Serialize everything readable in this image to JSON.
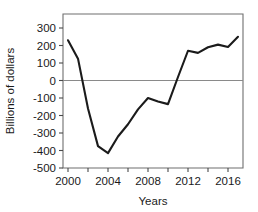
{
  "chart_data": {
    "type": "line",
    "title": "",
    "xlabel": "Years",
    "ylabel": "Billions of dollars",
    "xlim": [
      1999.5,
      2017.5
    ],
    "ylim": [
      -500,
      380
    ],
    "grid": false,
    "legend": null,
    "x_ticks": [
      2000,
      2002,
      2004,
      2006,
      2008,
      2010,
      2012,
      2014,
      2016
    ],
    "x_tick_labels": [
      "2000",
      "",
      "2004",
      "",
      "2008",
      "",
      "2012",
      "",
      "2016"
    ],
    "y_ticks": [
      300,
      200,
      100,
      0,
      -100,
      -200,
      -300,
      -400,
      -500
    ],
    "y_tick_labels": [
      "300",
      "200",
      "100",
      "0",
      "-100",
      "-200",
      "-300",
      "-400",
      "-500"
    ],
    "zero_line": 0,
    "x": [
      2000,
      2001,
      2002,
      2003,
      2004,
      2005,
      2006,
      2007,
      2008,
      2009,
      2010,
      2011,
      2012,
      2013,
      2014,
      2015,
      2016,
      2017
    ],
    "values": [
      230,
      125,
      -160,
      -375,
      -415,
      -320,
      -250,
      -165,
      -100,
      -120,
      -135,
      20,
      170,
      158,
      190,
      205,
      192,
      250
    ],
    "series": [
      {
        "name": "Billions of dollars",
        "color": "#1b1b1b",
        "values": [
          230,
          125,
          -160,
          -375,
          -415,
          -320,
          -250,
          -165,
          -100,
          -120,
          -135,
          20,
          170,
          158,
          190,
          205,
          192,
          250
        ]
      }
    ]
  },
  "axes": {
    "ylabel": "Billions of dollars",
    "xlabel": "Years"
  }
}
